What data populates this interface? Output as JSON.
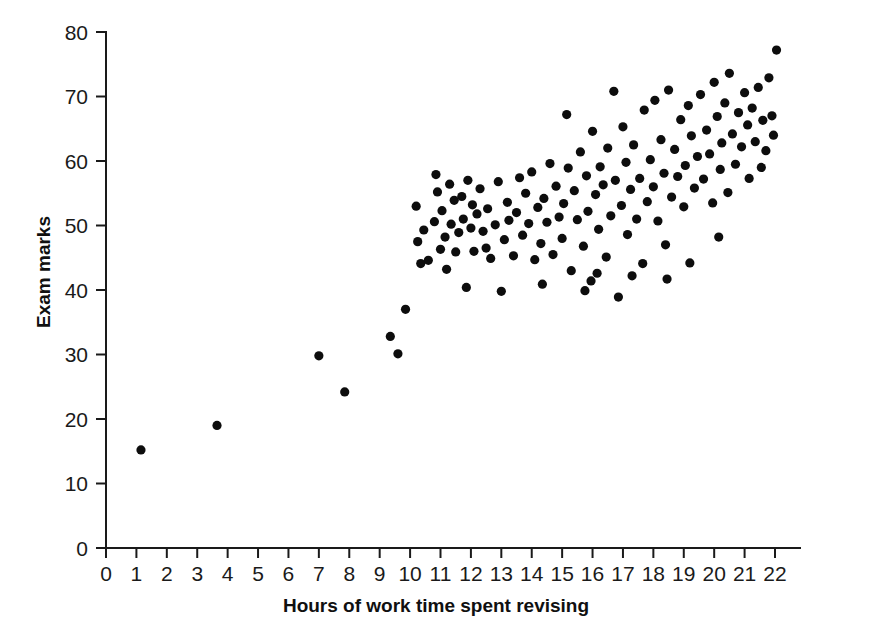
{
  "chart_data": {
    "type": "scatter",
    "title": "",
    "xlabel": "Hours of work time spent revising",
    "ylabel": "Exam marks",
    "xlim": [
      0,
      23.2
    ],
    "ylim": [
      0,
      80
    ],
    "xticks": [
      0,
      1,
      2,
      3,
      4,
      5,
      6,
      7,
      8,
      9,
      10,
      11,
      12,
      13,
      14,
      15,
      16,
      17,
      18,
      19,
      20,
      21,
      22
    ],
    "xtick_labels": [
      "0",
      "1",
      "2",
      "3",
      "4",
      "5",
      "6",
      "7",
      "8",
      "9",
      "10",
      "11",
      "12",
      "13",
      "14",
      "15",
      "16",
      "17",
      "18",
      "19",
      "20",
      "21",
      "22"
    ],
    "yticks": [
      0,
      10,
      20,
      30,
      40,
      50,
      60,
      70,
      80
    ],
    "ytick_labels": [
      "0",
      "10",
      "20",
      "30",
      "40",
      "50",
      "60",
      "70",
      "80"
    ],
    "grid": false,
    "legend": null,
    "marker": {
      "shape": "circle",
      "color": "#0d0d0d",
      "radius_px": 4.6
    },
    "point_count": 146,
    "points": [
      [
        1.15,
        15.2
      ],
      [
        3.65,
        19.0
      ],
      [
        7.0,
        29.8
      ],
      [
        7.85,
        24.2
      ],
      [
        9.35,
        32.8
      ],
      [
        9.6,
        30.1
      ],
      [
        9.85,
        37.0
      ],
      [
        10.2,
        53.0
      ],
      [
        10.25,
        47.5
      ],
      [
        10.35,
        44.1
      ],
      [
        10.45,
        49.3
      ],
      [
        10.6,
        44.6
      ],
      [
        10.8,
        50.6
      ],
      [
        10.85,
        57.9
      ],
      [
        10.9,
        55.2
      ],
      [
        11.0,
        46.3
      ],
      [
        11.05,
        52.3
      ],
      [
        11.15,
        48.2
      ],
      [
        11.2,
        43.2
      ],
      [
        11.3,
        56.4
      ],
      [
        11.35,
        50.2
      ],
      [
        11.45,
        53.9
      ],
      [
        11.5,
        45.9
      ],
      [
        11.6,
        48.9
      ],
      [
        11.7,
        54.5
      ],
      [
        11.75,
        51.0
      ],
      [
        11.85,
        40.4
      ],
      [
        11.9,
        57.0
      ],
      [
        12.0,
        49.6
      ],
      [
        12.05,
        53.2
      ],
      [
        12.1,
        46.0
      ],
      [
        12.2,
        51.8
      ],
      [
        12.3,
        55.7
      ],
      [
        12.4,
        49.1
      ],
      [
        12.5,
        46.5
      ],
      [
        12.55,
        52.6
      ],
      [
        12.65,
        44.9
      ],
      [
        12.8,
        50.1
      ],
      [
        12.9,
        56.8
      ],
      [
        13.0,
        39.8
      ],
      [
        13.1,
        47.8
      ],
      [
        13.2,
        53.6
      ],
      [
        13.25,
        50.8
      ],
      [
        13.4,
        45.3
      ],
      [
        13.5,
        52.0
      ],
      [
        13.6,
        57.4
      ],
      [
        13.7,
        48.5
      ],
      [
        13.8,
        55.0
      ],
      [
        13.9,
        50.3
      ],
      [
        14.0,
        58.3
      ],
      [
        14.1,
        44.7
      ],
      [
        14.2,
        52.8
      ],
      [
        14.3,
        47.2
      ],
      [
        14.4,
        54.2
      ],
      [
        14.5,
        50.5
      ],
      [
        14.6,
        59.6
      ],
      [
        14.7,
        45.5
      ],
      [
        14.8,
        56.1
      ],
      [
        14.9,
        51.3
      ],
      [
        15.0,
        48.0
      ],
      [
        15.05,
        53.4
      ],
      [
        15.15,
        67.2
      ],
      [
        15.2,
        58.9
      ],
      [
        15.3,
        43.0
      ],
      [
        15.4,
        55.4
      ],
      [
        15.5,
        50.9
      ],
      [
        15.6,
        61.4
      ],
      [
        15.7,
        46.8
      ],
      [
        15.8,
        57.7
      ],
      [
        15.85,
        52.2
      ],
      [
        15.95,
        41.4
      ],
      [
        16.0,
        64.6
      ],
      [
        16.1,
        54.8
      ],
      [
        16.2,
        49.4
      ],
      [
        16.25,
        59.1
      ],
      [
        16.35,
        56.3
      ],
      [
        16.45,
        45.1
      ],
      [
        16.5,
        62.0
      ],
      [
        16.6,
        51.5
      ],
      [
        16.7,
        70.8
      ],
      [
        16.75,
        57.0
      ],
      [
        16.85,
        38.9
      ],
      [
        16.95,
        53.1
      ],
      [
        17.0,
        65.3
      ],
      [
        17.1,
        59.8
      ],
      [
        17.15,
        48.6
      ],
      [
        17.25,
        55.6
      ],
      [
        17.35,
        62.5
      ],
      [
        17.45,
        51.0
      ],
      [
        17.55,
        57.3
      ],
      [
        17.65,
        44.1
      ],
      [
        17.7,
        67.9
      ],
      [
        17.8,
        53.7
      ],
      [
        17.9,
        60.2
      ],
      [
        18.0,
        56.0
      ],
      [
        18.05,
        69.4
      ],
      [
        18.15,
        50.7
      ],
      [
        18.25,
        63.3
      ],
      [
        18.35,
        58.1
      ],
      [
        18.4,
        47.0
      ],
      [
        18.5,
        71.0
      ],
      [
        18.6,
        54.4
      ],
      [
        18.7,
        61.8
      ],
      [
        18.8,
        57.6
      ],
      [
        18.9,
        66.4
      ],
      [
        19.0,
        52.9
      ],
      [
        19.05,
        59.3
      ],
      [
        19.15,
        68.6
      ],
      [
        19.25,
        63.9
      ],
      [
        19.35,
        55.8
      ],
      [
        19.45,
        60.7
      ],
      [
        19.55,
        70.3
      ],
      [
        19.65,
        57.2
      ],
      [
        19.75,
        64.8
      ],
      [
        19.85,
        61.1
      ],
      [
        19.95,
        53.5
      ],
      [
        20.0,
        72.2
      ],
      [
        20.1,
        66.9
      ],
      [
        20.2,
        58.7
      ],
      [
        20.25,
        62.8
      ],
      [
        20.35,
        69.0
      ],
      [
        20.45,
        55.1
      ],
      [
        20.5,
        73.6
      ],
      [
        20.6,
        64.2
      ],
      [
        20.7,
        59.5
      ],
      [
        20.8,
        67.5
      ],
      [
        20.9,
        62.2
      ],
      [
        21.0,
        70.6
      ],
      [
        21.1,
        65.6
      ],
      [
        21.15,
        57.3
      ],
      [
        21.25,
        68.2
      ],
      [
        21.35,
        63.0
      ],
      [
        21.45,
        71.4
      ],
      [
        21.55,
        59.0
      ],
      [
        21.6,
        66.3
      ],
      [
        21.7,
        61.6
      ],
      [
        21.8,
        72.9
      ],
      [
        21.9,
        67.0
      ],
      [
        21.95,
        64.0
      ],
      [
        22.05,
        77.2
      ],
      [
        20.15,
        48.2
      ],
      [
        19.2,
        44.2
      ],
      [
        18.45,
        41.7
      ],
      [
        17.3,
        42.2
      ],
      [
        16.15,
        42.6
      ],
      [
        15.75,
        39.9
      ],
      [
        14.35,
        40.9
      ]
    ]
  },
  "axes": {
    "x_axis_name": "x-axis",
    "y_axis_name": "y-axis"
  }
}
